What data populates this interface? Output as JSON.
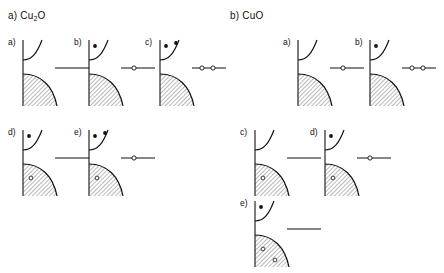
{
  "figure": {
    "type": "diagram",
    "colors": {
      "ink": "#111111",
      "background": "#ffffff",
      "hatch": "#333333"
    },
    "legend_semantics": {
      "filled-dot": "electron",
      "open-circle": "hole",
      "horizontal-line": "defect level",
      "hatched-region": "filled valence band",
      "upper-curve": "conduction band"
    }
  },
  "sections": [
    {
      "key": "cu2o",
      "label": "a)",
      "formula_pre": "Cu",
      "formula_sub": "2",
      "formula_post": "O",
      "title_full": "a) Cu2O",
      "panels": [
        {
          "label": "a)",
          "x": 8,
          "y": 38,
          "electrons": 0,
          "holes_in_band": 0,
          "defect": {
            "line": true,
            "circles": 0
          }
        },
        {
          "label": "b)",
          "x": 74,
          "y": 38,
          "electrons": 1,
          "holes_in_band": 0,
          "defect": {
            "line": true,
            "circles": 1
          }
        },
        {
          "label": "c)",
          "x": 145,
          "y": 38,
          "electrons": 2,
          "holes_in_band": 0,
          "defect": {
            "line": true,
            "circles": 2
          }
        },
        {
          "label": "d)",
          "x": 8,
          "y": 128,
          "electrons": 1,
          "holes_in_band": 1,
          "defect": {
            "line": true,
            "circles": 0
          }
        },
        {
          "label": "e)",
          "x": 74,
          "y": 128,
          "electrons": 2,
          "holes_in_band": 1,
          "defect": {
            "line": true,
            "circles": 1
          }
        }
      ]
    },
    {
      "key": "cuo",
      "label": "b)",
      "formula_pre": "Cu",
      "formula_sub": "",
      "formula_post": "O",
      "title_full": "b) CuO",
      "panels": [
        {
          "label": "a)",
          "x": 283,
          "y": 38,
          "electrons": 0,
          "holes_in_band": 0,
          "defect": {
            "line": true,
            "circles": 1
          }
        },
        {
          "label": "b)",
          "x": 355,
          "y": 38,
          "electrons": 1,
          "holes_in_band": 0,
          "defect": {
            "line": true,
            "circles": 2
          }
        },
        {
          "label": "c)",
          "x": 240,
          "y": 128,
          "electrons": 0,
          "holes_in_band": 1,
          "defect": {
            "line": true,
            "circles": 0
          }
        },
        {
          "label": "d)",
          "x": 310,
          "y": 128,
          "electrons": 1,
          "holes_in_band": 1,
          "defect": {
            "line": true,
            "circles": 1
          }
        },
        {
          "label": "e)",
          "x": 240,
          "y": 199,
          "electrons": 1,
          "holes_in_band": 2,
          "defect": {
            "line": true,
            "circles": 0
          }
        }
      ]
    }
  ]
}
